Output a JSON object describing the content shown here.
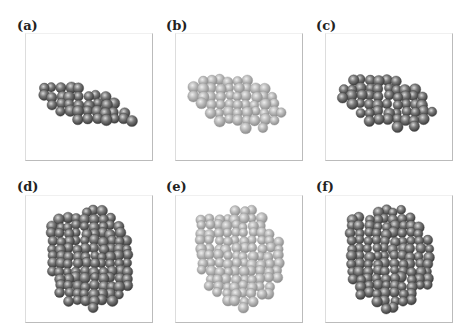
{
  "figure": {
    "panels": [
      {
        "id": "a",
        "label": "(a)",
        "shape": "flat-ellipse",
        "tone": "dark",
        "color": "#6a6a6a"
      },
      {
        "id": "b",
        "label": "(b)",
        "shape": "flat-ellipse-wide",
        "tone": "light",
        "color": "#a8a8a8"
      },
      {
        "id": "c",
        "label": "(c)",
        "shape": "flat-ellipse-wide",
        "tone": "dark",
        "color": "#6a6a6a"
      },
      {
        "id": "d",
        "label": "(d)",
        "shape": "rounded-polyhedron",
        "tone": "dark",
        "color": "#6a6a6a"
      },
      {
        "id": "e",
        "label": "(e)",
        "shape": "rounded-polyhedron",
        "tone": "light",
        "color": "#a8a8a8"
      },
      {
        "id": "f",
        "label": "(f)",
        "shape": "rounded-polyhedron",
        "tone": "dark",
        "color": "#6a6a6a"
      }
    ]
  }
}
